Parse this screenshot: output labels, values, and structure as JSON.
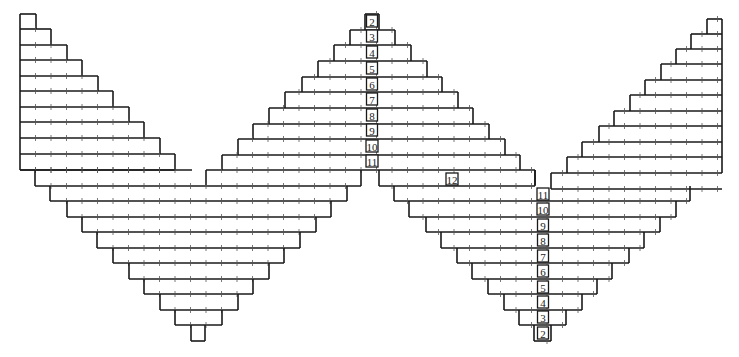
{
  "diagram": {
    "type": "knitting-stitch-chart",
    "colors": {
      "line": "#1a1a1a",
      "tick": "#555555",
      "background": "#ffffff"
    },
    "grid": {
      "cell_width": 15.5,
      "row_height": 15.3
    },
    "left_triangle": {
      "description": "left-aligned stepped increase section, left edge fixed",
      "left_x": 20,
      "rows": [
        {
          "y": 14,
          "right_x": 36
        },
        {
          "y": 29,
          "right_x": 51
        },
        {
          "y": 45,
          "right_x": 67
        },
        {
          "y": 60,
          "right_x": 82
        },
        {
          "y": 76,
          "right_x": 98
        },
        {
          "y": 91,
          "right_x": 113
        },
        {
          "y": 107,
          "right_x": 129
        },
        {
          "y": 122,
          "right_x": 144
        },
        {
          "y": 138,
          "right_x": 160
        },
        {
          "y": 154,
          "right_x": 175
        },
        {
          "y": 170,
          "right_x": 175
        }
      ]
    },
    "center_pyramid": {
      "description": "upward stepped pyramid centered on label axis",
      "axis_x": 372,
      "rows": [
        {
          "y": 14,
          "left_x": 365,
          "right_x": 379
        },
        {
          "y": 30,
          "left_x": 350,
          "right_x": 395
        },
        {
          "y": 45,
          "left_x": 334,
          "right_x": 411
        },
        {
          "y": 61,
          "left_x": 318,
          "right_x": 427
        },
        {
          "y": 77,
          "left_x": 302,
          "right_x": 442
        },
        {
          "y": 92,
          "left_x": 285,
          "right_x": 458
        },
        {
          "y": 108,
          "left_x": 269,
          "right_x": 473
        },
        {
          "y": 124,
          "left_x": 253,
          "right_x": 489
        },
        {
          "y": 139,
          "left_x": 238,
          "right_x": 505
        },
        {
          "y": 155,
          "left_x": 222,
          "right_x": 520
        },
        {
          "y": 170,
          "left_x": 206,
          "right_x": 535
        }
      ]
    },
    "left_v": {
      "description": "downward stepped V (decrease) below left sections",
      "rows": [
        {
          "y": 170,
          "left_x": 20,
          "right_x": 192
        },
        {
          "y": 186,
          "left_x": 35,
          "right_x": 361
        },
        {
          "y": 201,
          "left_x": 50,
          "right_x": 347
        },
        {
          "y": 217,
          "left_x": 67,
          "right_x": 331
        },
        {
          "y": 232,
          "left_x": 82,
          "right_x": 316
        },
        {
          "y": 248,
          "left_x": 97,
          "right_x": 300
        },
        {
          "y": 263,
          "left_x": 113,
          "right_x": 284
        },
        {
          "y": 279,
          "left_x": 129,
          "right_x": 269
        },
        {
          "y": 294,
          "left_x": 144,
          "right_x": 253
        },
        {
          "y": 310,
          "left_x": 160,
          "right_x": 238
        },
        {
          "y": 325,
          "left_x": 175,
          "right_x": 222
        },
        {
          "y": 341,
          "left_x": 191,
          "right_x": 205
        }
      ]
    },
    "right_v": {
      "description": "downward stepped V on the right half centered on second label axis",
      "axis_x": 542,
      "rows": [
        {
          "y": 186,
          "left_x": 379,
          "right_x": 535
        },
        {
          "y": 201,
          "left_x": 394,
          "right_x": 690
        },
        {
          "y": 217,
          "left_x": 409,
          "right_x": 676
        },
        {
          "y": 232,
          "left_x": 426,
          "right_x": 660
        },
        {
          "y": 248,
          "left_x": 441,
          "right_x": 644
        },
        {
          "y": 263,
          "left_x": 457,
          "right_x": 629
        },
        {
          "y": 279,
          "left_x": 472,
          "right_x": 612
        },
        {
          "y": 294,
          "left_x": 488,
          "right_x": 597
        },
        {
          "y": 310,
          "left_x": 504,
          "right_x": 582
        },
        {
          "y": 325,
          "left_x": 519,
          "right_x": 566
        },
        {
          "y": 341,
          "left_x": 534,
          "right_x": 551
        }
      ]
    },
    "right_triangle": {
      "description": "right-aligned stepped increase section, right edge fixed",
      "right_x": 722,
      "rows": [
        {
          "y": 19,
          "left_x": 707
        },
        {
          "y": 34,
          "left_x": 691
        },
        {
          "y": 49,
          "left_x": 676
        },
        {
          "y": 64,
          "left_x": 661
        },
        {
          "y": 80,
          "left_x": 645
        },
        {
          "y": 95,
          "left_x": 630
        },
        {
          "y": 111,
          "left_x": 614
        },
        {
          "y": 126,
          "left_x": 599
        },
        {
          "y": 142,
          "left_x": 582
        },
        {
          "y": 157,
          "left_x": 567
        },
        {
          "y": 173,
          "left_x": 551
        },
        {
          "y": 189,
          "left_x": 551
        }
      ]
    },
    "labels_center": [
      {
        "text": "2",
        "x": 372,
        "y": 22
      },
      {
        "text": "3",
        "x": 372,
        "y": 37
      },
      {
        "text": "4",
        "x": 372,
        "y": 53
      },
      {
        "text": "5",
        "x": 372,
        "y": 69
      },
      {
        "text": "6",
        "x": 372,
        "y": 85
      },
      {
        "text": "7",
        "x": 372,
        "y": 100
      },
      {
        "text": "8",
        "x": 372,
        "y": 116
      },
      {
        "text": "9",
        "x": 372,
        "y": 131
      },
      {
        "text": "10",
        "x": 372,
        "y": 147
      },
      {
        "text": "11",
        "x": 372,
        "y": 162
      }
    ],
    "labels_right": [
      {
        "text": "11",
        "x": 543,
        "y": 195
      },
      {
        "text": "10",
        "x": 543,
        "y": 210
      },
      {
        "text": "9",
        "x": 543,
        "y": 226
      },
      {
        "text": "8",
        "x": 543,
        "y": 241
      },
      {
        "text": "7",
        "x": 543,
        "y": 257
      },
      {
        "text": "6",
        "x": 543,
        "y": 272
      },
      {
        "text": "5",
        "x": 543,
        "y": 288
      },
      {
        "text": "4",
        "x": 543,
        "y": 303
      },
      {
        "text": "3",
        "x": 543,
        "y": 318
      },
      {
        "text": "2",
        "x": 543,
        "y": 334
      }
    ],
    "label_extra": {
      "text": "12",
      "x": 452,
      "y": 180
    }
  }
}
